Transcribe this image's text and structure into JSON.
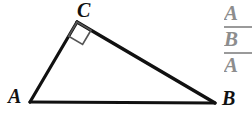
{
  "figure": {
    "type": "right-triangle-diagram",
    "background_color": "#ffffff",
    "stroke_color": "#111111",
    "right_angle_marker_color": "#555555",
    "vertices": {
      "A": {
        "label": "A",
        "x": 30,
        "y": 102
      },
      "B": {
        "label": "B",
        "x": 215,
        "y": 103
      },
      "C": {
        "label": "C",
        "x": 77,
        "y": 22
      }
    },
    "labels": {
      "a": "A",
      "b": "B",
      "c": "C"
    },
    "right_angle_at": "C"
  },
  "answer_choices": {
    "color": "#8d8d8d",
    "rule_color": "#9a9a9a",
    "items": [
      {
        "letter": "A",
        "has_rule_above": false
      },
      {
        "letter": "B",
        "has_rule_above": true
      },
      {
        "letter": "A",
        "has_rule_above": true
      }
    ]
  }
}
